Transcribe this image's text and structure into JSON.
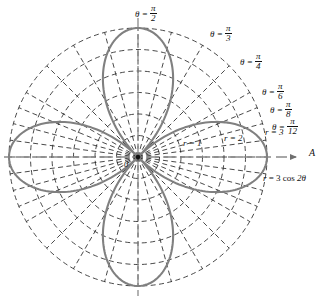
{
  "figure": {
    "kind": "polar-plot",
    "axis_label": "A",
    "origin_label": "0",
    "curve_equation_parts": {
      "lhs": "r",
      "eq": "=",
      "coef": "3",
      "fn": "cos",
      "arg": "2θ"
    },
    "curve_equation": "r = 3 cos 2θ",
    "radius_labels": [
      {
        "name": "r-1",
        "text": "r = 1"
      },
      {
        "name": "r-2",
        "text": "r = 2"
      },
      {
        "name": "r-3",
        "text": "r = 3"
      }
    ],
    "angle_labels": [
      {
        "name": "theta-pi-2",
        "lhs": "θ =",
        "num": "π",
        "den": "2"
      },
      {
        "name": "theta-pi-3",
        "lhs": "θ =",
        "num": "π",
        "den": "3"
      },
      {
        "name": "theta-pi-4",
        "lhs": "θ =",
        "num": "π",
        "den": "4"
      },
      {
        "name": "theta-pi-6",
        "lhs": "θ =",
        "num": "π",
        "den": "6"
      },
      {
        "name": "theta-pi-8",
        "lhs": "θ =",
        "num": "π",
        "den": "8"
      },
      {
        "name": "theta-pi-12",
        "lhs": "θ =",
        "num": "π",
        "den": "12"
      }
    ],
    "colors": {
      "curve": "#808080",
      "grid": "#1a1a1a",
      "axis": "#7a7a7a",
      "background": "#ffffff"
    }
  },
  "chart_data": {
    "type": "line",
    "plot_kind": "polar",
    "title": "",
    "xlabel": "A",
    "ylabel": "",
    "series": [
      {
        "name": "r = 3 cos 2θ",
        "equation": "r = 3 cos 2θ",
        "petals": 4,
        "max_r": 3,
        "petal_axis_angles_deg": [
          0,
          90,
          180,
          270
        ],
        "petal_tip_points_polar": [
          {
            "theta_deg": 0,
            "r": 3
          },
          {
            "theta_deg": 90,
            "r": 3
          },
          {
            "theta_deg": 180,
            "r": 3
          },
          {
            "theta_deg": 270,
            "r": 3
          }
        ],
        "zeros_theta_deg": [
          45,
          135,
          225,
          315
        ]
      }
    ],
    "radial_axis": {
      "label": "r",
      "ticks": [
        1,
        2,
        3
      ],
      "tick_labels": [
        "r = 1",
        "r = 2",
        "r = 3"
      ],
      "range": [
        0,
        3
      ],
      "minor_ticks": [
        0.5,
        1.5,
        2.5
      ]
    },
    "angular_axis": {
      "label": "θ",
      "labeled_angles": [
        "π/12",
        "π/8",
        "π/6",
        "π/4",
        "π/3",
        "π/2"
      ],
      "labeled_angles_deg": [
        15,
        22.5,
        30,
        45,
        60,
        90
      ],
      "ray_spacing_deg": 15
    },
    "grid": true,
    "legend": "none"
  }
}
